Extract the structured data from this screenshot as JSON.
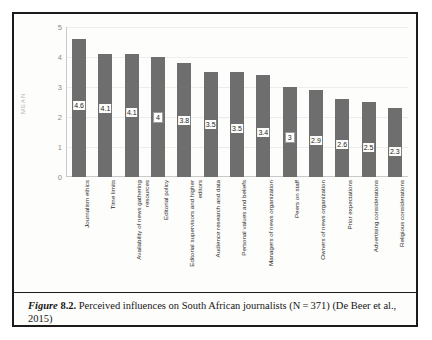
{
  "figure": {
    "label_italic": "Figure",
    "label_number": "8.2.",
    "caption_text": "Perceived influences on South African journalists (N = 371) (De Beer et al., 2015)"
  },
  "chart_data": {
    "type": "bar",
    "title": "",
    "xlabel": "",
    "ylabel": "MEAN",
    "ylim": [
      0,
      5
    ],
    "yticks": [
      5,
      4,
      3,
      2,
      1,
      0
    ],
    "grid": true,
    "legend": "none",
    "bar_color": "#6e6e6e",
    "categories": [
      "Journalism ethics",
      "Time limits",
      "Availability of news gathering resources",
      "Editorial policy",
      "Editorial supervisors and higher editors",
      "Audience research and data",
      "Personal values and beliefs",
      "Managers of news organization",
      "Peers on staff",
      "Owners of news organization",
      "Prior expectations",
      "Advertising considerations",
      "Religious considerations"
    ],
    "category_lines": [
      [
        "Journalism ethics",
        ""
      ],
      [
        "Time limits",
        ""
      ],
      [
        "Availability of news gathering",
        "resources"
      ],
      [
        "Editorial policy",
        ""
      ],
      [
        "Editorial supervisors and higher",
        "editors"
      ],
      [
        "Audience research and data",
        ""
      ],
      [
        "Personal values and beliefs",
        ""
      ],
      [
        "Managers of news organization",
        ""
      ],
      [
        "Peers on staff",
        ""
      ],
      [
        "Owners of news organization",
        ""
      ],
      [
        "Prior expectations",
        ""
      ],
      [
        "Advertising considerations",
        ""
      ],
      [
        "Religious considerations",
        ""
      ]
    ],
    "values": [
      4.6,
      4.1,
      4.1,
      4,
      3.8,
      3.5,
      3.5,
      3.4,
      3,
      2.9,
      2.6,
      2.5,
      2.3
    ],
    "value_labels": [
      "4.6",
      "4.1",
      "4.1",
      "4",
      "3.8",
      "3.5",
      "3.5",
      "3.4",
      "3",
      "2.9",
      "2.6",
      "2.5",
      "2.3"
    ],
    "value_label_boxed": [
      false,
      false,
      false,
      true,
      false,
      false,
      false,
      false,
      true,
      false,
      false,
      false,
      false
    ]
  }
}
